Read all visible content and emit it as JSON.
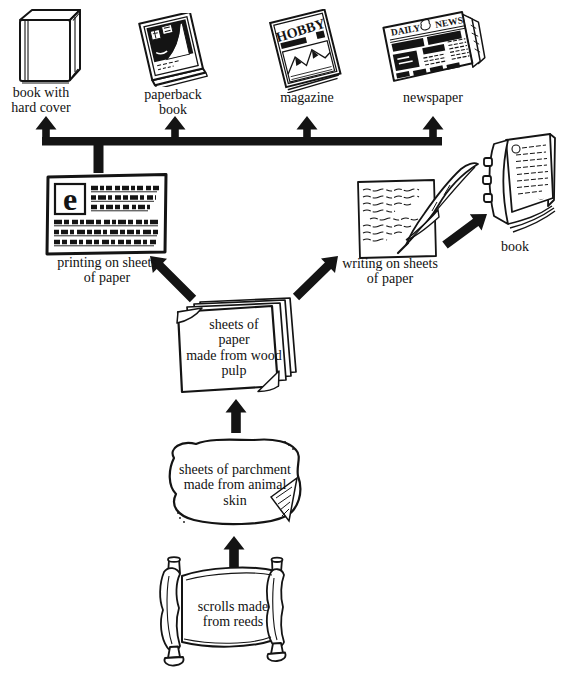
{
  "colors": {
    "ink": "#141414",
    "paper": "#ffffff"
  },
  "nodes": {
    "book_hard_cover": {
      "label_lines": [
        "book with",
        "hard cover"
      ]
    },
    "paperback_book": {
      "label_lines": [
        "paperback",
        "book"
      ]
    },
    "magazine": {
      "label": "magazine",
      "cover_title": "HOBBY"
    },
    "newspaper": {
      "label": "newspaper",
      "masthead_left": "DAILY",
      "masthead_right": "NEWS"
    },
    "printing": {
      "label_lines": [
        "printing on sheets",
        "of paper"
      ],
      "initial": "e"
    },
    "writing": {
      "label_lines": [
        "writing on sheets",
        "of paper"
      ]
    },
    "bound_book": {
      "label": "book"
    },
    "paper_sheets": {
      "text_lines": [
        "sheets of",
        "paper",
        "made from wood",
        "pulp"
      ]
    },
    "parchment": {
      "text_lines": [
        "sheets of parchment",
        "made from animal",
        "skin"
      ]
    },
    "scroll": {
      "text_lines": [
        "scrolls made",
        "from reeds"
      ]
    }
  },
  "edges": [
    {
      "from": "scrolls made from reeds",
      "to": "sheets of parchment made from animal skin"
    },
    {
      "from": "sheets of parchment made from animal skin",
      "to": "sheets of paper made from wood pulp"
    },
    {
      "from": "sheets of paper made from wood pulp",
      "to": "printing on sheets of paper"
    },
    {
      "from": "sheets of paper made from wood pulp",
      "to": "writing on sheets of paper"
    },
    {
      "from": "writing on sheets of paper",
      "to": "book"
    },
    {
      "from": "printing on sheets of paper",
      "to": "book with hard cover"
    },
    {
      "from": "printing on sheets of paper",
      "to": "paperback book"
    },
    {
      "from": "printing on sheets of paper",
      "to": "magazine"
    },
    {
      "from": "printing on sheets of paper",
      "to": "newspaper"
    }
  ]
}
